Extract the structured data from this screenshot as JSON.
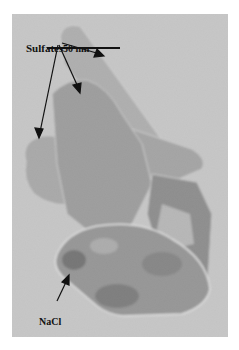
{
  "figure": {
    "type": "TEM micrograph",
    "background_color": "#c9c9c9",
    "particle_color": "#8e8e8e",
    "annotations": {
      "sulfates_label": "Sulfates",
      "nacl_label": "NaCl",
      "scale_bar_label": "50 nm"
    },
    "arrows": [
      {
        "from": "Sulfates",
        "target": "upper rod"
      },
      {
        "from": "Sulfates",
        "target": "middle plate"
      },
      {
        "from": "Sulfates",
        "target": "left lobe"
      },
      {
        "from": "NaCl",
        "target": "NaCl crystal edge"
      }
    ]
  }
}
